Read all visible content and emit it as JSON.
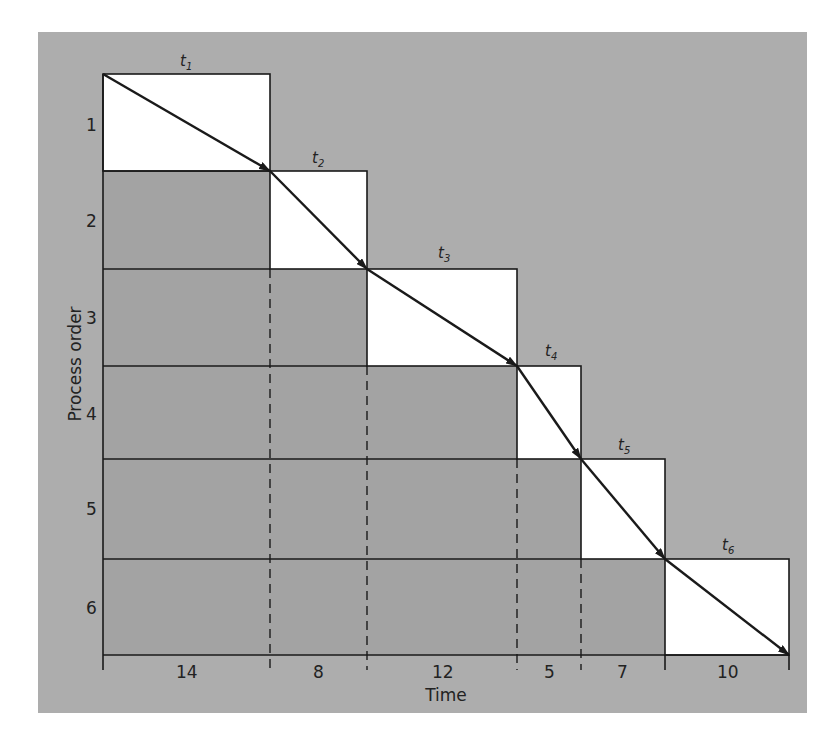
{
  "colors": {
    "background": "#ffffff",
    "panel": "#adadad",
    "shaded_cell": "#a3a3a3",
    "active_cell": "#ffffff",
    "line": "#1a1a1a"
  },
  "axis": {
    "y_label": "Process order",
    "x_label": "Time",
    "rows": [
      "1",
      "2",
      "3",
      "4",
      "5",
      "6"
    ]
  },
  "processes": [
    {
      "label": "t",
      "sub": "1",
      "duration": "14"
    },
    {
      "label": "t",
      "sub": "2",
      "duration": "8"
    },
    {
      "label": "t",
      "sub": "3",
      "duration": "12"
    },
    {
      "label": "t",
      "sub": "4",
      "duration": "5"
    },
    {
      "label": "t",
      "sub": "5",
      "duration": "7"
    },
    {
      "label": "t",
      "sub": "6",
      "duration": "10"
    }
  ],
  "chart_data": {
    "type": "table",
    "xlabel": "Time",
    "ylabel": "Process order",
    "categories": [
      "t1",
      "t2",
      "t3",
      "t4",
      "t5",
      "t6"
    ],
    "process_order": [
      1,
      2,
      3,
      4,
      5,
      6
    ],
    "durations": [
      14,
      8,
      12,
      5,
      7,
      10
    ],
    "start_times": [
      0,
      14,
      22,
      34,
      39,
      46
    ],
    "end_times": [
      14,
      22,
      34,
      39,
      46,
      56
    ],
    "total_time": 56
  }
}
